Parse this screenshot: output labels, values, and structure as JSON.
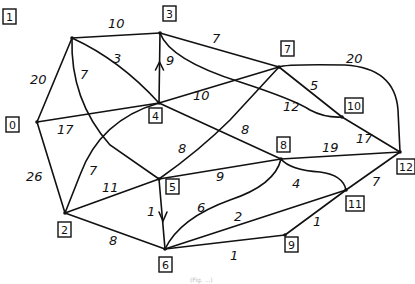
{
  "diagram": {
    "type": "weighted-graph",
    "nodes": [
      {
        "id": "0",
        "label": "0",
        "x": 37,
        "y": 122,
        "bx": 6,
        "by": 117
      },
      {
        "id": "1",
        "label": "1",
        "x": 72,
        "y": 38,
        "bx": 3,
        "by": 9
      },
      {
        "id": "2",
        "label": "2",
        "x": 65,
        "y": 213,
        "bx": 58,
        "by": 222
      },
      {
        "id": "3",
        "label": "3",
        "x": 160,
        "y": 33,
        "bx": 163,
        "by": 6
      },
      {
        "id": "4",
        "label": "4",
        "x": 159,
        "y": 103,
        "bx": 149,
        "by": 108
      },
      {
        "id": "5",
        "label": "5",
        "x": 159,
        "y": 179,
        "bx": 166,
        "by": 179
      },
      {
        "id": "6",
        "label": "6",
        "x": 165,
        "y": 249,
        "bx": 159,
        "by": 257
      },
      {
        "id": "7",
        "label": "7",
        "x": 279,
        "y": 67,
        "bx": 281,
        "by": 41
      },
      {
        "id": "8",
        "label": "8",
        "x": 281,
        "y": 159,
        "bx": 277,
        "by": 137
      },
      {
        "id": "9",
        "label": "9",
        "x": 285,
        "y": 235,
        "bx": 285,
        "by": 237
      },
      {
        "id": "10",
        "label": "10",
        "x": 342,
        "y": 117,
        "bx": 345,
        "by": 98
      },
      {
        "id": "11",
        "label": "11",
        "x": 346,
        "y": 190,
        "bx": 346,
        "by": 196
      },
      {
        "id": "12",
        "label": "12",
        "x": 400,
        "y": 152,
        "bx": 397,
        "by": 159
      }
    ],
    "edges": [
      {
        "from": "1",
        "to": "3",
        "weight": "10",
        "d": "M72,38 L160,33",
        "lx": 108,
        "ly": 28
      },
      {
        "from": "1",
        "to": "0",
        "weight": "20",
        "d": "M72,38 L37,122",
        "lx": 30,
        "ly": 84
      },
      {
        "from": "1",
        "to": "4",
        "weight": "3",
        "d": "M72,38 Q120,60 159,103",
        "lx": 113,
        "ly": 63
      },
      {
        "from": "1",
        "to": "5",
        "weight": "7",
        "d": "M72,38 Q70,100 110,145 L159,179",
        "lx": 80,
        "ly": 79
      },
      {
        "from": "3",
        "to": "4",
        "weight": "9",
        "d": "M160,33 L159,103",
        "lx": 166,
        "ly": 65,
        "arrow": "up"
      },
      {
        "from": "3",
        "to": "7",
        "weight": "7",
        "d": "M160,33 L279,67",
        "lx": 212,
        "ly": 43
      },
      {
        "from": "3",
        "to": "10",
        "weight": "12",
        "d": "M160,33 Q170,60 240,82 Q295,100 310,110 Q325,118 342,117",
        "lx": 283,
        "ly": 111
      },
      {
        "from": "4",
        "to": "0",
        "weight": "17",
        "d": "M37,122 L159,103",
        "lx": 57,
        "ly": 134
      },
      {
        "from": "4",
        "to": "7",
        "weight": "10",
        "d": "M159,103 L279,67",
        "lx": 193,
        "ly": 100
      },
      {
        "from": "4",
        "to": "8",
        "weight": "8",
        "d": "M159,103 L281,159",
        "lx": 241,
        "ly": 134
      },
      {
        "from": "4",
        "to": "2",
        "weight": "7",
        "d": "M159,103 Q100,120 80,175 L65,213",
        "lx": 89,
        "ly": 175
      },
      {
        "from": "0",
        "to": "2",
        "weight": "26",
        "d": "M37,122 L65,213",
        "lx": 26,
        "ly": 181
      },
      {
        "from": "2",
        "to": "5",
        "weight": "11",
        "d": "M65,213 L159,179",
        "lx": 102,
        "ly": 192
      },
      {
        "from": "2",
        "to": "6",
        "weight": "8",
        "d": "M65,213 L165,249",
        "lx": 109,
        "ly": 245
      },
      {
        "from": "5",
        "to": "6",
        "weight": "1",
        "d": "M159,179 L165,249",
        "lx": 147,
        "ly": 216,
        "arrow": "down"
      },
      {
        "from": "5",
        "to": "7",
        "weight": "8",
        "d": "M159,179 Q200,150 230,120 L279,67",
        "lx": 178,
        "ly": 153
      },
      {
        "from": "5",
        "to": "8",
        "weight": "9",
        "d": "M159,179 L281,159",
        "lx": 216,
        "ly": 181
      },
      {
        "from": "7",
        "to": "10",
        "weight": "5",
        "d": "M279,67 L342,117",
        "lx": 310,
        "ly": 90
      },
      {
        "from": "7",
        "to": "12",
        "weight": "20",
        "d": "M279,67 Q285,64 345,65 Q395,68 398,110 L400,152",
        "lx": 346,
        "ly": 63
      },
      {
        "from": "10",
        "to": "12",
        "weight": "17",
        "d": "M342,117 L400,152",
        "lx": 356,
        "ly": 143
      },
      {
        "from": "8",
        "to": "12",
        "weight": "19",
        "d": "M281,159 L400,152",
        "lx": 322,
        "ly": 152
      },
      {
        "from": "8",
        "to": "11",
        "weight": "4",
        "d": "M281,159 Q290,170 320,172 Q343,175 346,190",
        "lx": 292,
        "ly": 188
      },
      {
        "from": "8",
        "to": "6",
        "weight": "6",
        "d": "M281,159 Q275,185 230,200 Q180,218 165,249",
        "lx": 197,
        "ly": 212
      },
      {
        "from": "6",
        "to": "11",
        "weight": "2",
        "d": "M165,249 L346,190",
        "lx": 234,
        "ly": 221
      },
      {
        "from": "6",
        "to": "9",
        "weight": "1",
        "d": "M165,249 L285,235",
        "lx": 230,
        "ly": 260
      },
      {
        "from": "9",
        "to": "11",
        "weight": "1",
        "d": "M285,235 L346,190",
        "lx": 313,
        "ly": 226
      },
      {
        "from": "11",
        "to": "12",
        "weight": "7",
        "d": "M346,190 L400,152",
        "lx": 372,
        "ly": 186
      }
    ]
  },
  "caption": "(Fig. ...)"
}
